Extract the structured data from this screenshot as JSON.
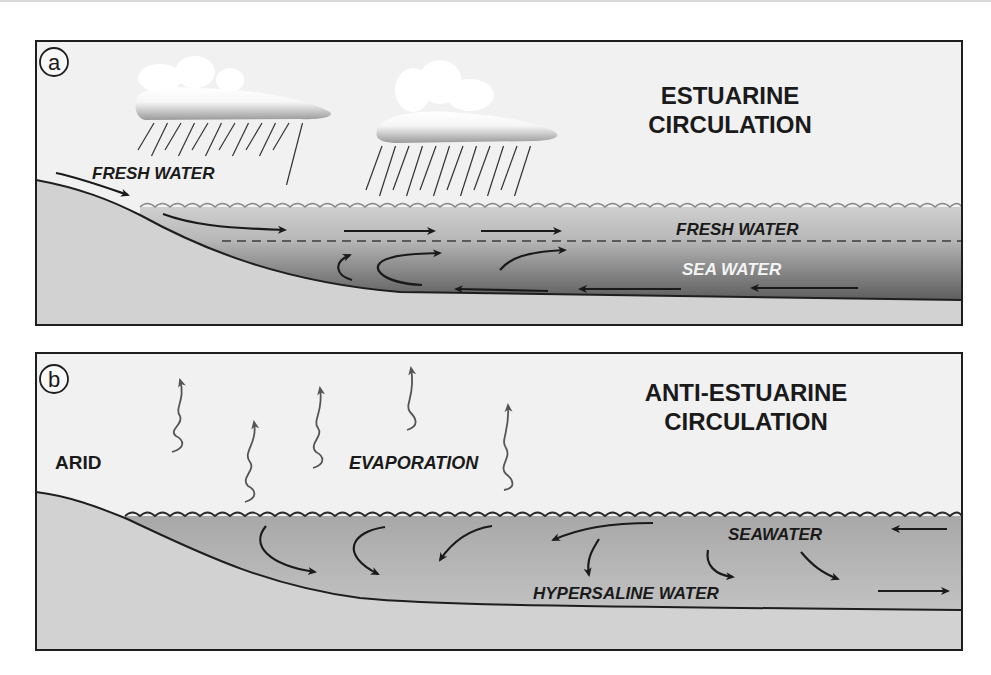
{
  "panels": [
    {
      "id": "a",
      "badge": "a",
      "title_lines": [
        "ESTUARINE",
        "CIRCULATION"
      ],
      "labels": {
        "input": "FRESH WATER",
        "upper_layer": "FRESH WATER",
        "lower_layer": "SEA WATER"
      },
      "icons": [
        "cloud-icon",
        "cloud-icon",
        "rain-icon",
        "rain-icon"
      ]
    },
    {
      "id": "b",
      "badge": "b",
      "title_lines": [
        "ANTI-ESTUARINE",
        "CIRCULATION"
      ],
      "labels": {
        "climate": "ARID",
        "process": "EVAPORATION",
        "inflow": "SEAWATER",
        "outflow": "HYPERSALINE WATER"
      },
      "icons": [
        "evaporation-arrow-icon"
      ]
    }
  ],
  "colors": {
    "sky": "#f1f1f1",
    "land": "#d2d2d2",
    "fresh_water": "#c4c4c4",
    "sea_water_dark": "#6e6e6e",
    "hypersaline": "#b4b4b4",
    "outline": "#1e1e1e",
    "sea_water_label": "#f4f4f4"
  }
}
